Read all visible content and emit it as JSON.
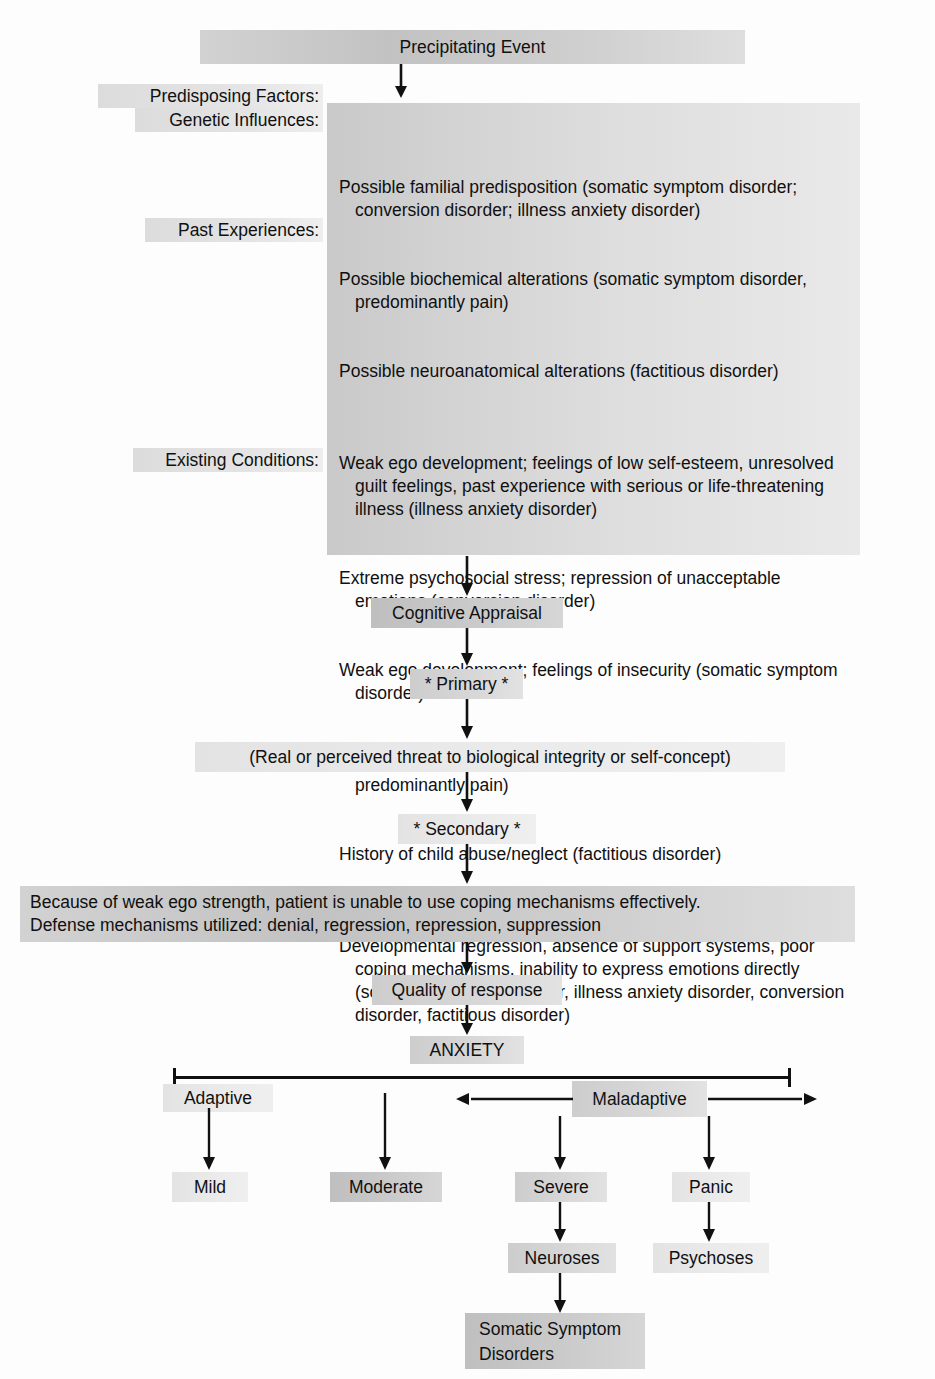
{
  "diagram": {
    "top_node": "Precipitating Event",
    "left_labels": {
      "predisposing": "Predisposing Factors:",
      "genetic": "Genetic Influences:",
      "past": "Past Experiences:",
      "existing": "Existing Conditions:"
    },
    "factors_block": {
      "genetic": [
        "Possible familial predisposition (somatic symptom disorder; conversion disorder; illness anxiety disorder)",
        "Possible biochemical alterations (somatic symptom disorder, predominantly pain)",
        "Possible neuroanatomical alterations (factitious disorder)"
      ],
      "past_experiences": [
        "Weak ego development; feelings of low self-esteem, unresolved guilt feelings, past experience with serious or life-threatening illness (illness anxiety disorder)",
        "Extreme psychosocial stress; repression of unacceptable emotions (conversion disorder)",
        "Weak ego development; feelings of insecurity (somatic symptom disorder)",
        "Unresolved guilt feelings (somatic symptom disorder, predominantly pain)",
        "History of child abuse/neglect (factitious disorder)"
      ],
      "existing_conditions": [
        "Developmental regression, absence of support systems, poor coping mechanisms, inability to express emotions directly (somatic symptom disorder, illness anxiety disorder, conversion disorder, factitious disorder)"
      ]
    },
    "cognitive_appraisal": "Cognitive Appraisal",
    "primary": "* Primary *",
    "primary_detail": "(Real or perceived threat to biological integrity or self-concept)",
    "secondary": "* Secondary *",
    "secondary_detail": "Because of weak ego strength, patient is unable to use coping mechanisms effectively.\nDefense mechanisms utilized: denial, regression, repression, suppression",
    "quality_of_response": "Quality of response",
    "anxiety": "ANXIETY",
    "scale": {
      "adaptive": "Adaptive",
      "maladaptive": "Maladaptive"
    },
    "levels": {
      "mild": "Mild",
      "moderate": "Moderate",
      "severe": "Severe",
      "panic": "Panic"
    },
    "outcomes": {
      "neuroses": "Neuroses",
      "psychoses": "Psychoses",
      "somatic": "Somatic Symptom\nDisorders"
    },
    "colors": {
      "ink": "#111111",
      "fill_dark": "#c2c2c2",
      "fill_mid": "#d6d6d6",
      "fill_light": "#e8e8e8",
      "page": "#ffffff"
    }
  }
}
